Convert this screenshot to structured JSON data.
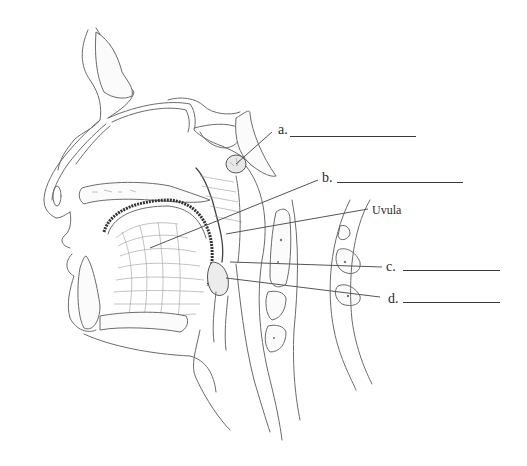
{
  "diagram": {
    "type": "anatomical-sagittal-section",
    "labels": [
      {
        "id": "a",
        "text": "a.",
        "answer_blank": true
      },
      {
        "id": "b",
        "text": "b.",
        "answer_blank": true
      },
      {
        "id": "uvula",
        "text": "Uvula",
        "answer_blank": false
      },
      {
        "id": "c",
        "text": "c.",
        "answer_blank": true
      },
      {
        "id": "d",
        "text": "d.",
        "answer_blank": true
      }
    ]
  }
}
